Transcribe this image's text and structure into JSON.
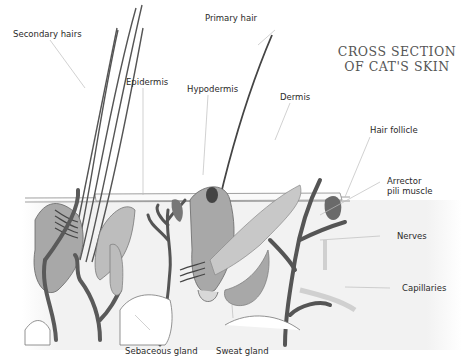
{
  "title": {
    "line1": "CROSS SECTION",
    "line2": "OF CAT'S SKIN"
  },
  "labels": [
    {
      "id": "secondary-hairs",
      "text": "Secondary hairs"
    },
    {
      "id": "primary-hair",
      "text": "Primary hair"
    },
    {
      "id": "epidermis",
      "text": "Epidermis"
    },
    {
      "id": "hypodermis",
      "text": "Hypodermis"
    },
    {
      "id": "dermis",
      "text": "Dermis"
    },
    {
      "id": "hair-follicle",
      "text": "Hair follicle"
    },
    {
      "id": "arrector-pili-muscle",
      "text": "Arrector",
      "text2": "pili muscle"
    },
    {
      "id": "nerves",
      "text": "Nerves"
    },
    {
      "id": "capillaries",
      "text": "Capillaries"
    },
    {
      "id": "sebaceous-gland",
      "text": "Sebaceous gland"
    },
    {
      "id": "sweat-gland",
      "text": "Sweat gland"
    }
  ],
  "colors": {
    "ink": "#3a3a3a",
    "tissue_light": "#cfcfcf",
    "tissue_mid": "#a8a8a8",
    "vessel_dark": "#5a5a5a",
    "leader": "#bdbdbd"
  }
}
